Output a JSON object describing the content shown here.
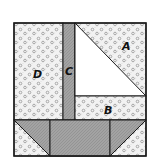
{
  "diagram": {
    "type": "quilt-block",
    "pieces": [
      {
        "id": "A",
        "label": "A",
        "fabric": "dotted"
      },
      {
        "id": "B",
        "label": "B",
        "fabric": "dotted"
      },
      {
        "id": "C",
        "label": "C",
        "fabric": "gray-crosshatch"
      },
      {
        "id": "D",
        "label": "D",
        "fabric": "dotted"
      },
      {
        "id": "sail",
        "label": "",
        "fabric": "white"
      },
      {
        "id": "hull",
        "label": "",
        "fabric": "gray-crosshatch"
      }
    ]
  },
  "colors": {
    "outline": "#1a1a1a",
    "background_fabric": "#f4f4f4",
    "dot": "#8a8a8a",
    "gray_fabric": "#9a9a9a",
    "sail": "#ffffff"
  }
}
